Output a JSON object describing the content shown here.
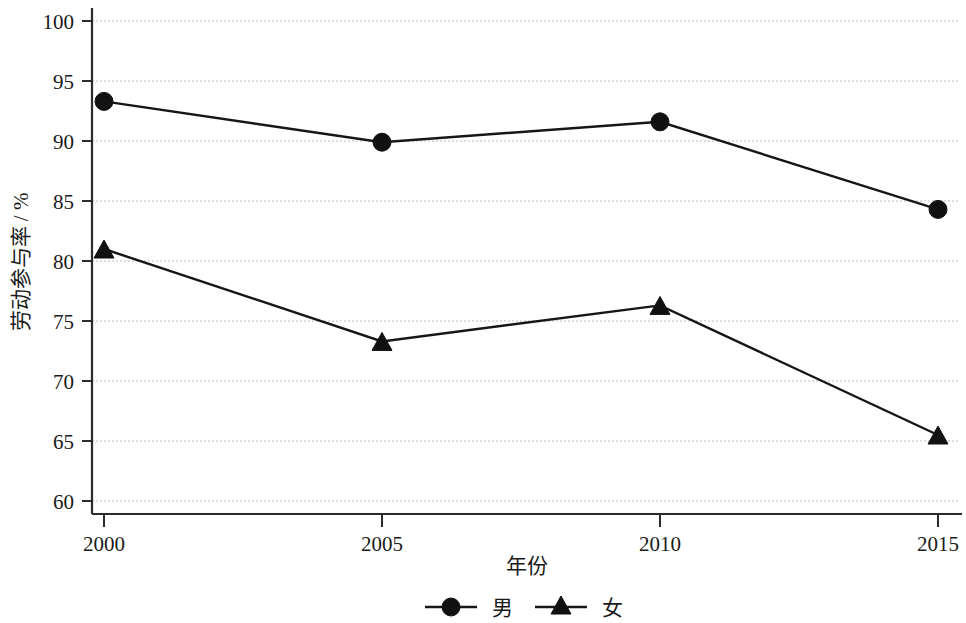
{
  "chart_data": {
    "type": "line",
    "title": "",
    "xlabel": "年份",
    "ylabel": "劳动参与率 / %",
    "x": [
      2000,
      2005,
      2010,
      2015
    ],
    "xtick_labels": [
      "2000",
      "2005",
      "2010",
      "2015"
    ],
    "ytick_labels": [
      "60",
      "65",
      "70",
      "75",
      "80",
      "85",
      "90",
      "95",
      "100"
    ],
    "ytick_values": [
      60,
      65,
      70,
      75,
      80,
      85,
      90,
      95,
      100
    ],
    "ylim": [
      60,
      100
    ],
    "xlim": [
      2000,
      2015
    ],
    "grid": "horizontal-dashed",
    "legend_position": "bottom-center",
    "series": [
      {
        "name": "男",
        "marker": "circle",
        "color": "#111111",
        "values": [
          93.3,
          89.9,
          91.6,
          84.3
        ]
      },
      {
        "name": "女",
        "marker": "triangle",
        "color": "#111111",
        "values": [
          81.0,
          73.3,
          76.3,
          65.5
        ]
      }
    ],
    "legend": [
      {
        "label": "男",
        "marker": "circle"
      },
      {
        "label": "女",
        "marker": "triangle"
      }
    ]
  }
}
